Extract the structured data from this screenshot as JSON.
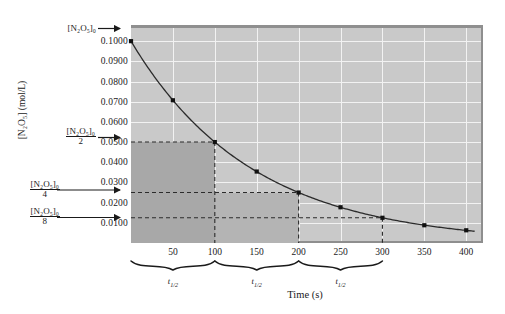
{
  "chart_data": {
    "type": "line",
    "title": "",
    "xlabel": "Time (s)",
    "ylabel": "[N₂O₅] (mol/L)",
    "xlim": [
      0,
      420
    ],
    "ylim": [
      0,
      0.108
    ],
    "grid": true,
    "legend": "none",
    "x": [
      0,
      50,
      100,
      150,
      200,
      250,
      300,
      350,
      400
    ],
    "values": [
      0.1,
      0.0707,
      0.05,
      0.0354,
      0.025,
      0.0177,
      0.0125,
      0.0088,
      0.0063
    ],
    "series": [
      {
        "name": "[N2O5]",
        "values": [
          0.1,
          0.0707,
          0.05,
          0.0354,
          0.025,
          0.0177,
          0.0125,
          0.0088,
          0.0063
        ]
      }
    ],
    "xticks": [
      50,
      100,
      150,
      200,
      250,
      300,
      350,
      400
    ],
    "xtick_labels": [
      "50",
      "100",
      "150",
      "200",
      "250",
      "300",
      "350",
      "400"
    ],
    "yticks": [
      0.1,
      0.09,
      0.08,
      0.07,
      0.06,
      0.05,
      0.04,
      0.03,
      0.02,
      0.01
    ],
    "ytick_labels": [
      "0.1000",
      "0.0900",
      "0.0800",
      "0.0700",
      "0.0600",
      "0.0500",
      "0.0400",
      "0.0300",
      "0.0200",
      "0.0100"
    ],
    "half_life": 100,
    "annotations": [
      {
        "id": "c0",
        "numerator": "[N₂O₅]₀",
        "denominator": "",
        "value": 0.1,
        "arrow": "short"
      },
      {
        "id": "c2",
        "numerator": "[N₂O₅]₀",
        "denominator": "2",
        "value": 0.05,
        "arrow": "short"
      },
      {
        "id": "c4",
        "numerator": "[N₂O₅]₀",
        "denominator": "4",
        "value": 0.025,
        "arrow": "long"
      },
      {
        "id": "c8",
        "numerator": "[N₂O₅]₀",
        "denominator": "8",
        "value": 0.0125,
        "arrow": "long"
      }
    ],
    "half_life_braces": [
      {
        "label": "t",
        "sub": "1/2",
        "from": 0,
        "to": 100
      },
      {
        "label": "t",
        "sub": "1/2",
        "from": 100,
        "to": 200
      },
      {
        "label": "t",
        "sub": "1/2",
        "from": 200,
        "to": 300
      }
    ],
    "shaded_regions": [
      {
        "x_to": 100,
        "y_to": 0.05,
        "color": "#a8a8a8"
      },
      {
        "x_to": 200,
        "y_to": 0.025,
        "color": "#b4b4b4"
      }
    ],
    "guide_lines": [
      {
        "type": "horizontal",
        "y": 0.05,
        "x_to": 100
      },
      {
        "type": "vertical",
        "x": 100,
        "y_to": 0.05
      },
      {
        "type": "horizontal",
        "y": 0.025,
        "x_to": 200
      },
      {
        "type": "vertical",
        "x": 200,
        "y_to": 0.025
      },
      {
        "type": "horizontal",
        "y": 0.0125,
        "x_to": 300
      },
      {
        "type": "vertical",
        "x": 300,
        "y_to": 0.0125
      }
    ],
    "colors": {
      "plot_background": "#c9c9c9",
      "gridline": "#f2f2f2",
      "curve": "#2b2b2b",
      "shade_inner": "#a8a8a8",
      "shade_outer": "#b4b4b4",
      "text": "#1a1a1a"
    }
  },
  "axes": {
    "x_title": "Time (s)",
    "y_title": "[N₂O₅] (mol/L)"
  }
}
